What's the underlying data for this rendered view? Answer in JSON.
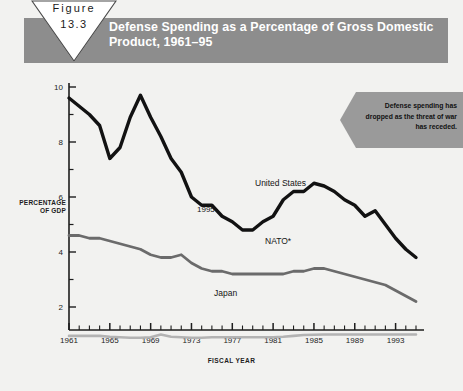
{
  "figure": {
    "badge_label": "Figure",
    "badge_number": "13.3",
    "title": "Defense Spending as a Percentage of Gross Domestic Product, 1961–95"
  },
  "callout": {
    "text": "Defense spending has dropped as the threat of war has receded."
  },
  "annotations": {
    "year_1995": "1995",
    "nato_footnote_marker": "*"
  },
  "colors": {
    "header_bar": "#8d8d8d",
    "page_background": "#f2f2f0",
    "united_states_line": "#121212",
    "nato_line": "#6b6b6b",
    "japan_line": "#b3b3b3",
    "callout_fill": "#9a9a9a",
    "axis": "#1d1d1d"
  },
  "chart_data": {
    "type": "line",
    "title": "Defense Spending as a Percentage of Gross Domestic Product, 1961–95",
    "xlabel": "FISCAL YEAR",
    "ylabel": "PERCENTAGE OF GDP",
    "xlim": [
      1961,
      1995
    ],
    "ylim": [
      0,
      10.4
    ],
    "yticks": [
      2,
      4,
      6,
      8,
      10
    ],
    "ytick_labels": [
      "2",
      "4",
      "6",
      "8",
      "10"
    ],
    "y_minor_ticks": [
      1,
      3,
      5,
      7,
      9
    ],
    "xticks": [
      1961,
      1965,
      1969,
      1973,
      1977,
      1981,
      1985,
      1989,
      1993
    ],
    "xtick_labels": [
      "1961",
      "1965",
      "1969",
      "1973",
      "1977",
      "1981",
      "1985",
      "1989",
      "1993"
    ],
    "x_all_years": [
      1961,
      1962,
      1963,
      1964,
      1965,
      1966,
      1967,
      1968,
      1969,
      1970,
      1971,
      1972,
      1973,
      1974,
      1975,
      1976,
      1977,
      1978,
      1979,
      1980,
      1981,
      1982,
      1983,
      1984,
      1985,
      1986,
      1987,
      1988,
      1989,
      1990,
      1991,
      1992,
      1993,
      1994,
      1995
    ],
    "grid": false,
    "legend_position": "inline-labels",
    "series": [
      {
        "name": "United States",
        "label": "United States",
        "color": "#121212",
        "values": [
          9.6,
          9.3,
          9.0,
          8.6,
          7.4,
          7.8,
          8.9,
          9.7,
          8.9,
          8.2,
          7.4,
          6.9,
          6.0,
          5.7,
          5.7,
          5.3,
          5.1,
          4.8,
          4.8,
          5.1,
          5.3,
          5.9,
          6.2,
          6.2,
          6.5,
          6.4,
          6.2,
          5.9,
          5.7,
          5.3,
          5.5,
          5.0,
          4.5,
          4.1,
          3.8
        ]
      },
      {
        "name": "NATO",
        "label": "NATO*",
        "color": "#6b6b6b",
        "values": [
          4.6,
          4.6,
          4.5,
          4.5,
          4.4,
          4.3,
          4.2,
          4.1,
          3.9,
          3.8,
          3.8,
          3.9,
          3.6,
          3.4,
          3.3,
          3.3,
          3.2,
          3.2,
          3.2,
          3.2,
          3.2,
          3.2,
          3.3,
          3.3,
          3.4,
          3.4,
          3.3,
          3.2,
          3.1,
          3.0,
          2.9,
          2.8,
          2.6,
          2.4,
          2.2
        ]
      },
      {
        "name": "Japan",
        "label": "Japan",
        "color": "#b3b3b3",
        "values": [
          0.95,
          0.95,
          0.95,
          0.95,
          0.92,
          0.9,
          0.88,
          0.88,
          0.9,
          1.0,
          0.92,
          0.9,
          0.88,
          0.88,
          0.9,
          0.9,
          0.9,
          0.9,
          0.9,
          0.9,
          0.9,
          0.92,
          0.95,
          0.98,
          0.99,
          1.0,
          1.0,
          1.0,
          1.0,
          1.0,
          1.0,
          1.0,
          1.0,
          1.0,
          1.0
        ]
      }
    ]
  }
}
